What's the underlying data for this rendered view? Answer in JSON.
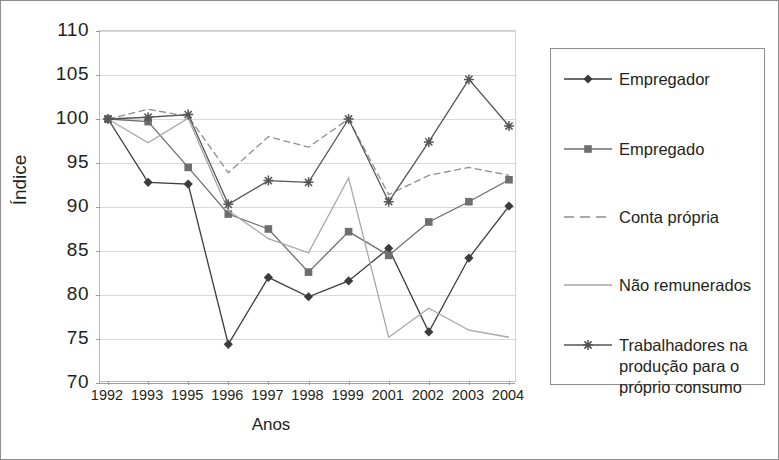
{
  "chart_data": {
    "type": "line",
    "title": "",
    "xlabel": "Anos",
    "ylabel": "Índice",
    "categories": [
      "1992",
      "1993",
      "1995",
      "1996",
      "1997",
      "1998",
      "1999",
      "2001",
      "2002",
      "2003",
      "2004"
    ],
    "ylim": [
      70,
      110
    ],
    "yticks": [
      70,
      75,
      80,
      85,
      90,
      95,
      100,
      105,
      110
    ],
    "grid": true,
    "legend_position": "right",
    "series": [
      {
        "name": "Empregador",
        "marker": "diamond",
        "line": "solid",
        "color": "#3b3b3b",
        "values": [
          100,
          92.8,
          92.6,
          74.4,
          82.0,
          79.8,
          81.6,
          85.3,
          75.8,
          84.2,
          90.1
        ]
      },
      {
        "name": "Empregado",
        "marker": "square",
        "line": "solid",
        "color": "#6e6e6e",
        "values": [
          100,
          99.7,
          94.5,
          89.2,
          87.5,
          82.6,
          87.2,
          84.5,
          88.3,
          90.6,
          93.1
        ]
      },
      {
        "name": "Conta própria",
        "marker": "none",
        "line": "dashed",
        "color": "#8e8e8e",
        "values": [
          100,
          101.1,
          100.3,
          93.9,
          98.0,
          96.8,
          100.0,
          91.4,
          93.6,
          94.5,
          93.6
        ]
      },
      {
        "name": "Não remunerados",
        "marker": "none",
        "line": "solid",
        "color": "#a6a6a6",
        "values": [
          100,
          97.3,
          100.1,
          89.6,
          86.4,
          84.8,
          93.3,
          75.2,
          78.5,
          76.0,
          75.2
        ]
      },
      {
        "name": "Trabalhadores na\nprodução para o\npróprio consumo",
        "marker": "asterisk",
        "line": "solid",
        "color": "#555555",
        "values": [
          100,
          100.2,
          100.5,
          90.3,
          93.0,
          92.8,
          100.0,
          90.6,
          97.4,
          104.5,
          99.2
        ]
      }
    ]
  },
  "axes": {
    "y_title": "Índice",
    "x_title": "Anos",
    "y_tick_labels": [
      "110",
      "105",
      "100",
      "95",
      "90",
      "85",
      "80",
      "75",
      "70"
    ],
    "x_tick_labels": [
      "1992",
      "1993",
      "1995",
      "1996",
      "1997",
      "1998",
      "1999",
      "2001",
      "2002",
      "2003",
      "2004"
    ]
  },
  "legend": {
    "items": [
      {
        "label": "Empregador"
      },
      {
        "label": "Empregado"
      },
      {
        "label": "Conta própria"
      },
      {
        "label": "Não remunerados"
      },
      {
        "label": "Trabalhadores na\nprodução para o\npróprio consumo"
      }
    ]
  }
}
